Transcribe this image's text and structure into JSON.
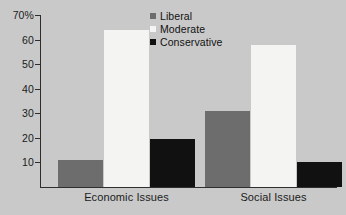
{
  "chart_data": {
    "type": "bar",
    "title": "",
    "subtitle": "",
    "xlabel": "",
    "ylabel": "",
    "categories": [
      "Economic Issues",
      "Social Issues"
    ],
    "series": [
      {
        "name": "Liberal",
        "color": "#6d6d6d",
        "values": [
          11,
          31
        ]
      },
      {
        "name": "Moderate",
        "color": "#f4f4f2",
        "values": [
          64,
          58
        ]
      },
      {
        "name": "Conservative",
        "color": "#111111",
        "values": [
          19.5,
          10
        ]
      }
    ],
    "ylim": [
      0,
      70
    ],
    "yticks": [
      10,
      20,
      30,
      40,
      50,
      60,
      70
    ],
    "ytick_labels": [
      "10",
      "20",
      "30",
      "40",
      "50",
      "60",
      "70%"
    ],
    "grid": false,
    "legend_position": "top-center-right",
    "background_color": "#c9c9c9",
    "axis_color": "#2e2e2e"
  },
  "axis": {
    "y_tick_labels": [
      "70%",
      "60",
      "50",
      "40",
      "30",
      "20",
      "10"
    ],
    "y_tick_values": [
      70,
      60,
      50,
      40,
      30,
      20,
      10
    ]
  },
  "groups": [
    {
      "label": "Economic Issues"
    },
    {
      "label": "Social Issues"
    }
  ],
  "legend": {
    "items": [
      {
        "label": "Liberal"
      },
      {
        "label": "Moderate"
      },
      {
        "label": "Conservative"
      }
    ]
  }
}
